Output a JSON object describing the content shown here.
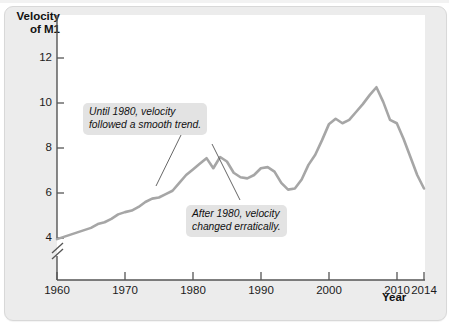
{
  "figure": {
    "y_axis_title_line1": "Velocity",
    "y_axis_title_line2": "of M1",
    "x_axis_title": "Year"
  },
  "chart_data": {
    "type": "line",
    "title": "",
    "xlabel": "Year",
    "ylabel": "Velocity of M1",
    "xlim": [
      1960,
      2014
    ],
    "ylim": [
      3.4,
      13.0
    ],
    "yticks": [
      4,
      6,
      8,
      10,
      12
    ],
    "xticks": [
      1960,
      1970,
      1980,
      1990,
      2000,
      2010,
      2014
    ],
    "ytick_labels": [
      "4",
      "6",
      "8",
      "10",
      "12"
    ],
    "xtick_labels": [
      "1960",
      "1970",
      "1980",
      "1990",
      "2000",
      "2010",
      "2014"
    ],
    "grid": false,
    "legend": null,
    "axis_break_below": 4,
    "line_color": "#a6a6a6",
    "series": [
      {
        "name": "Velocity of M1",
        "x": [
          1960,
          1961,
          1962,
          1963,
          1964,
          1965,
          1966,
          1967,
          1968,
          1969,
          1970,
          1971,
          1972,
          1973,
          1974,
          1975,
          1976,
          1977,
          1978,
          1979,
          1980,
          1981,
          1982,
          1983,
          1984,
          1985,
          1986,
          1987,
          1988,
          1989,
          1990,
          1991,
          1992,
          1993,
          1994,
          1995,
          1996,
          1997,
          1998,
          1999,
          2000,
          2001,
          2002,
          2003,
          2004,
          2005,
          2006,
          2007,
          2008,
          2009,
          2010,
          2011,
          2012,
          2013,
          2014
        ],
        "values": [
          3.95,
          4.05,
          4.15,
          4.25,
          4.35,
          4.45,
          4.62,
          4.7,
          4.85,
          5.05,
          5.15,
          5.22,
          5.38,
          5.6,
          5.75,
          5.8,
          5.95,
          6.1,
          6.45,
          6.8,
          7.05,
          7.3,
          7.55,
          7.1,
          7.6,
          7.4,
          6.9,
          6.7,
          6.65,
          6.8,
          7.1,
          7.15,
          6.95,
          6.45,
          6.15,
          6.2,
          6.6,
          7.25,
          7.7,
          8.35,
          9.05,
          9.3,
          9.1,
          9.25,
          9.6,
          9.95,
          10.35,
          10.7,
          10.05,
          9.25,
          9.1,
          8.4,
          7.6,
          6.8,
          6.2
        ]
      }
    ],
    "annotations": [
      {
        "name": "callout-smooth-trend",
        "line1": "Until 1980, velocity",
        "line2": "followed a smooth trend.",
        "points_to_year": 1977
      },
      {
        "name": "callout-erratic",
        "line1": "After 1980, velocity",
        "line2": "changed erratically.",
        "points_to_year": 1986
      }
    ]
  }
}
